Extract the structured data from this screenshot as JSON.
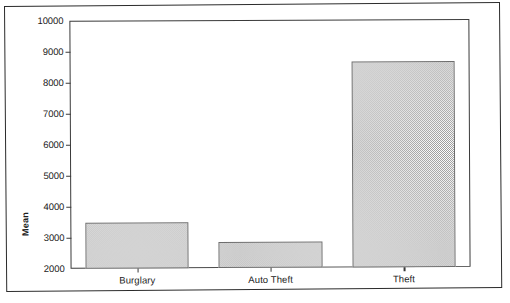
{
  "chart_data": {
    "type": "bar",
    "title": "",
    "subtitle": "",
    "xlabel": "",
    "ylabel": "Mean",
    "categories": [
      "Burglary",
      "Auto Theft",
      "Theft"
    ],
    "values": [
      3500,
      2850,
      8640
    ],
    "series": [
      {
        "name": "Mean",
        "values": [
          3500,
          2850,
          8640
        ]
      }
    ],
    "ylim": [
      2000,
      10000
    ],
    "y_ticks": [
      2000,
      3000,
      4000,
      5000,
      6000,
      7000,
      8000,
      9000,
      10000
    ],
    "y_tick_labels": [
      "2000",
      "3000",
      "4000",
      "5000",
      "6000",
      "7000",
      "8000",
      "9000",
      "10000"
    ],
    "grid": false,
    "legend": false,
    "legend_position": "none",
    "bar_fill": "#9a9a9a",
    "bar_border": "#6d6d6d",
    "axis_color": "#3a3a3a",
    "background": "#ffffff"
  }
}
